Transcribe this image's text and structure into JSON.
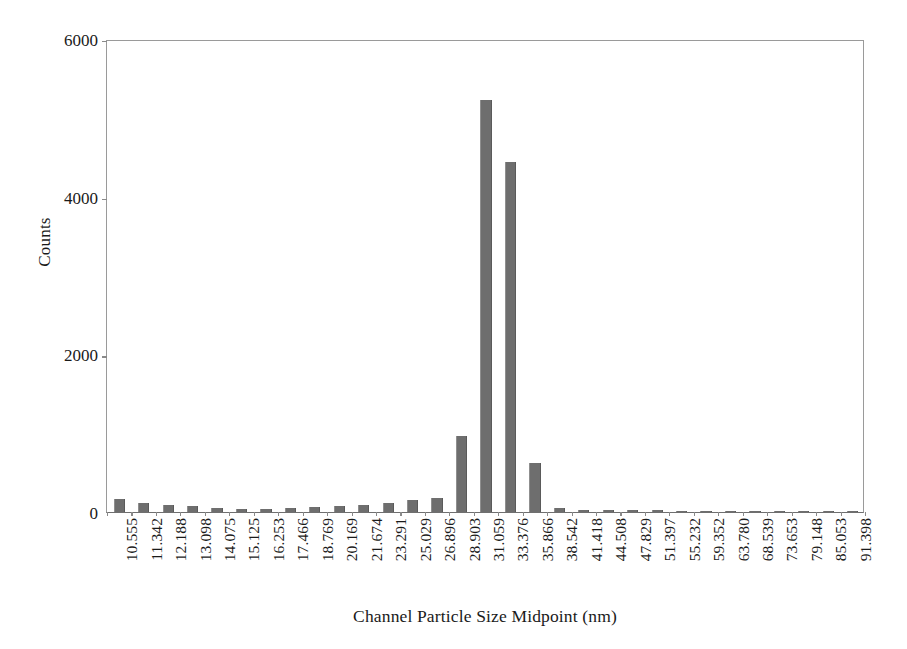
{
  "chart_data": {
    "type": "bar",
    "title": "",
    "xlabel": "Channel Particle Size Midpoint (nm)",
    "ylabel": "Counts",
    "ylim": [
      0,
      6000
    ],
    "yticks": [
      0,
      2000,
      4000,
      6000
    ],
    "ytick_labels": [
      "0",
      "2000",
      "4000",
      "6000"
    ],
    "grid": false,
    "legend": null,
    "bar_color": "#6e6e6e",
    "axis_color": "#8a8a8a",
    "categories": [
      "10.555",
      "11.342",
      "12.188",
      "13.098",
      "14.075",
      "15.125",
      "16.253",
      "17.466",
      "18.769",
      "20.169",
      "21.674",
      "23.291",
      "25.029",
      "26.896",
      "28.903",
      "31.059",
      "33.376",
      "35.866",
      "38.542",
      "41.418",
      "44.508",
      "47.829",
      "51.397",
      "55.232",
      "59.352",
      "63.780",
      "68.539",
      "73.653",
      "79.148",
      "85.053",
      "91.398"
    ],
    "values": [
      165,
      120,
      95,
      70,
      48,
      40,
      38,
      45,
      60,
      75,
      95,
      120,
      150,
      175,
      960,
      5230,
      4440,
      620,
      55,
      30,
      25,
      22,
      20,
      18,
      16,
      14,
      12,
      10,
      9,
      8,
      6
    ]
  }
}
